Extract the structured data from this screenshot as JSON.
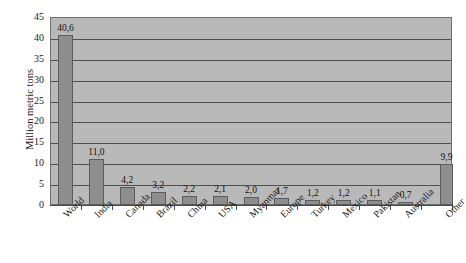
{
  "chart_data": {
    "type": "bar",
    "title": "",
    "xlabel": "",
    "ylabel": "Million metric tons",
    "ylim": [
      0,
      45
    ],
    "ytick_step": 5,
    "grid": true,
    "legend": "none",
    "decimal_separator": ",",
    "categories": [
      "World",
      "India",
      "Canada",
      "Brazil",
      "China",
      "USA",
      "Myanmar",
      "Europe",
      "Turkey",
      "Mexico",
      "Pakistan",
      "Australia",
      "Other"
    ],
    "values": [
      40.6,
      11.0,
      4.2,
      3.2,
      2.2,
      2.1,
      2.0,
      1.7,
      1.2,
      1.2,
      1.1,
      0.7,
      9.9
    ],
    "value_labels": [
      "40,6",
      "11,0",
      "4,2",
      "3,2",
      "2,2",
      "2,1",
      "2,0",
      "1,7",
      "1,2",
      "1,2",
      "1,1",
      "0,7",
      "9,9"
    ],
    "ytick_labels": [
      "0",
      "5",
      "10",
      "15",
      "20",
      "25",
      "30",
      "35",
      "40",
      "45"
    ],
    "colors": {
      "bar_fill": "#8e8e8e",
      "bar_edge": "#5c5c5c",
      "plot_background": "#b9b9b9",
      "gridline": "#4f4f4f",
      "axis": "#4a4a4a",
      "text": "#1a1a1a",
      "page_background": "#ffffff"
    }
  }
}
